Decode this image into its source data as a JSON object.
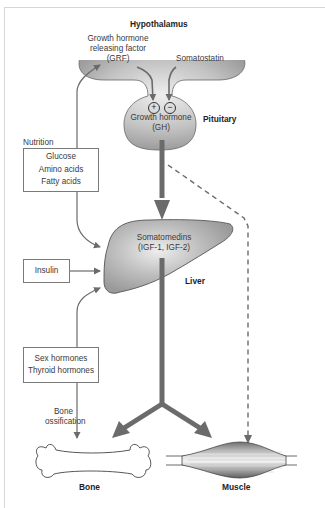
{
  "diagram": {
    "labels": {
      "hypothalamus": "Hypothalamus",
      "grf": [
        "Growth hormone",
        "releasing factor",
        "(GRF)"
      ],
      "somatostatin": "Somatostatin",
      "plus": "+",
      "minus": "−",
      "gh": [
        "Growth hormone",
        "(GH)"
      ],
      "pituitary": "Pituitary",
      "nutrition": "Nutrition",
      "somatomedins": [
        "Somatomedins",
        "(IGF-1, IGF-2)"
      ],
      "liver": "Liver",
      "bone_ossification": [
        "Bone",
        "ossification"
      ],
      "bone": "Bone",
      "muscle": "Muscle"
    },
    "boxes": {
      "nutrition_items": [
        "Glucose",
        "Amino acids",
        "Fatty acids"
      ],
      "insulin": "Insulin",
      "hormones": [
        "Sex hormones",
        "Thyroid hormones"
      ]
    },
    "colors": {
      "arrow": "#6b6b6b",
      "organ_fill": "#a8a8a8",
      "organ_highlight": "#e6e6e6",
      "organ_stroke": "#555555",
      "frame": "#d6d6d6"
    }
  }
}
